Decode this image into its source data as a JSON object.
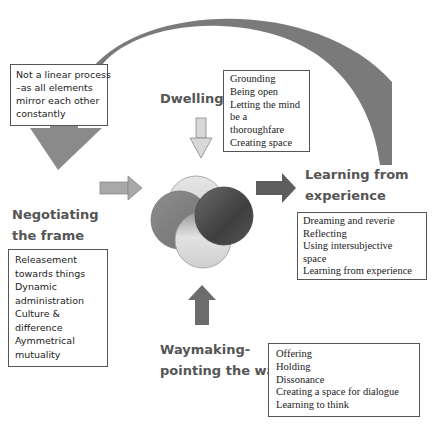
{
  "note_box": {
    "lines": [
      "Not a linear process",
      "–as all elements",
      "mirror each other",
      "constantly"
    ]
  },
  "dwelling": {
    "title": "Dwelling",
    "items": [
      "Grounding",
      "Being open",
      "Letting the mind",
      "be a",
      "thoroughfare",
      "Creating space"
    ]
  },
  "negotiating": {
    "title_lines": [
      "Negotiating",
      "the frame"
    ],
    "items": [
      "Releasement",
      "towards things",
      "Dynamic",
      "administration",
      "Culture &",
      "difference",
      "Aymmetrical",
      "mutuality"
    ]
  },
  "learning": {
    "title_lines": [
      "Learning from",
      "experience"
    ],
    "items": [
      "Dreaming and reverie",
      "Reflecting",
      "Using intersubjective",
      "space",
      "Learning from experience"
    ]
  },
  "waymaking": {
    "title_lines": [
      "Waymaking-",
      "pointing the way"
    ],
    "items": [
      "Offering",
      "Holding",
      "Dissonance",
      "Creating a space for dialogue",
      "Learning to think"
    ]
  },
  "colors": {
    "arc": "#7a7a7a",
    "arrow_dark": "#5e5e5e",
    "arrow_mid": "#8a8a8a",
    "arrow_light": "#d4d4d4",
    "label": "#555555"
  }
}
